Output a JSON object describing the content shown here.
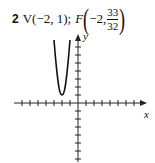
{
  "problem": {
    "number": "2",
    "vertex_label": "V(−2, 1);",
    "focus_prefix": "F",
    "focus_x": "−2,",
    "focus_y_num": "33",
    "focus_y_den": "32"
  },
  "graph": {
    "x_label": "x",
    "y_label": "y",
    "origin_px": [
      78,
      103
    ],
    "tick_spacing_px": 8,
    "vertex": [
      -2,
      1
    ],
    "curve": "parabola opening upward, narrow"
  }
}
